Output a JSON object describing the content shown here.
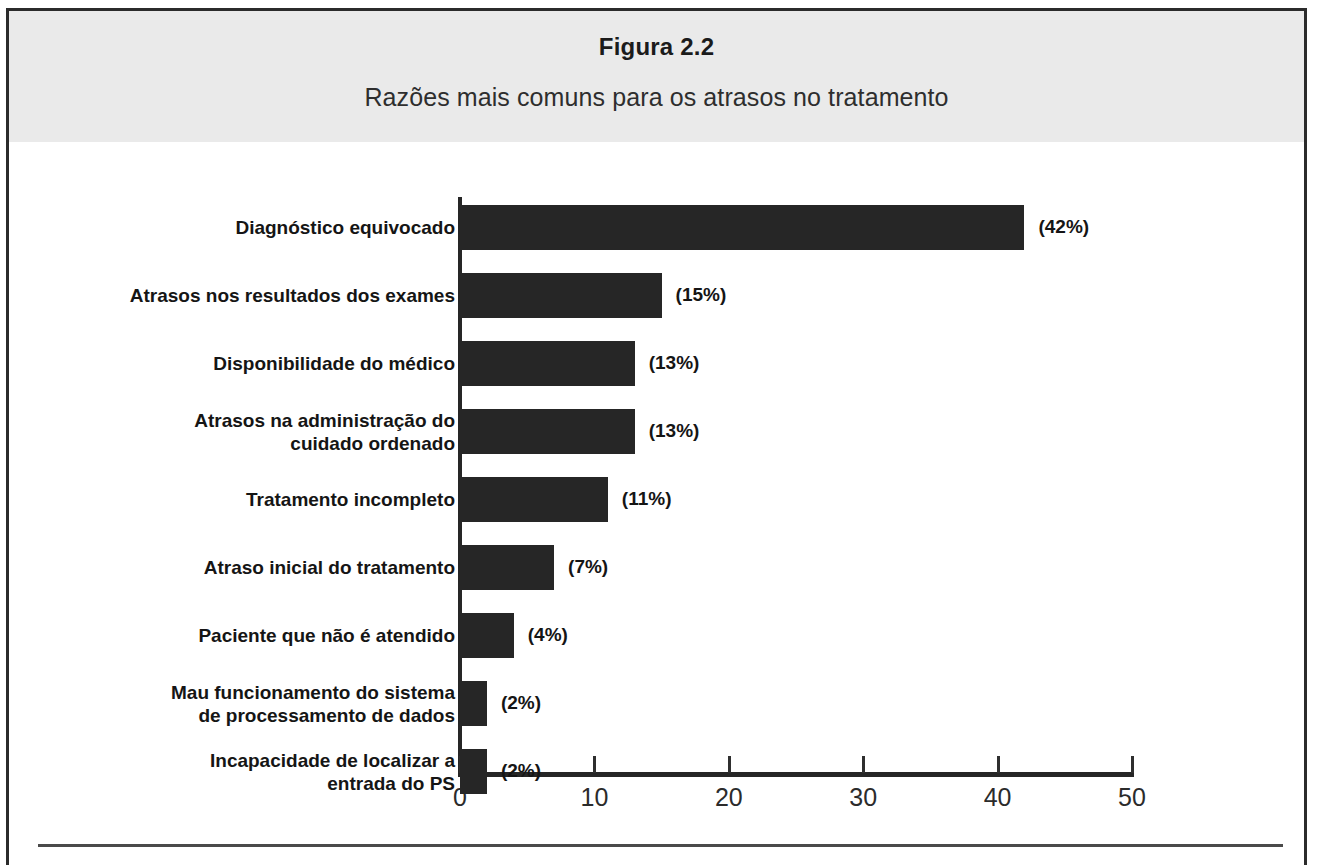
{
  "figure": {
    "title": "Figura 2.2",
    "subtitle": "Razões mais comuns para os atrasos no tratamento"
  },
  "chart_data": {
    "type": "bar",
    "orientation": "horizontal",
    "title": "Razões mais comuns para os atrasos no tratamento",
    "xlabel": "",
    "ylabel": "",
    "xlim": [
      0,
      50
    ],
    "grid": false,
    "legend": null,
    "xticks": [
      "0",
      "10",
      "20",
      "30",
      "40",
      "50"
    ],
    "xtick_values": [
      0,
      10,
      20,
      30,
      40,
      50
    ],
    "bar_color": "#262626",
    "categories": [
      "Diagnóstico equivocado",
      "Atrasos nos resultados dos exames",
      "Disponibilidade do médico",
      "Atrasos na administração do\ncuidado ordenado",
      "Tratamento incompleto",
      "Atraso inicial do tratamento",
      "Paciente que não é atendido",
      "Mau funcionamento do sistema\nde processamento de dados",
      "Incapacidade de localizar a\nentrada do PS"
    ],
    "values": [
      42,
      15,
      13,
      13,
      11,
      7,
      4,
      2,
      2
    ],
    "value_labels": [
      "(42%)",
      "(15%)",
      "(13%)",
      "(13%)",
      "(11%)",
      "(7%)",
      "(4%)",
      "(2%)",
      "(2%)"
    ]
  }
}
